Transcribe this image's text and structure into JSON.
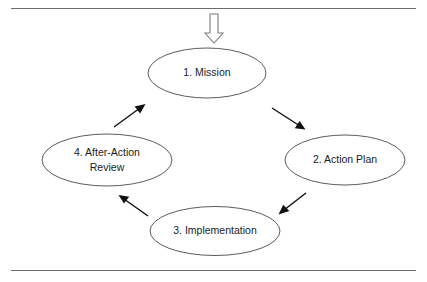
{
  "figure": {
    "background_color": "#ffffff",
    "node_outline_color": "#4a4a4a",
    "arrow_color": "#111111",
    "rule_color": "#6b6b6b",
    "text_color": "#1c1c1c"
  },
  "frame": {
    "top_rule_label": "top-horizontal-rule",
    "bottom_rule_label": "bottom-horizontal-rule"
  },
  "entry_arrow": {
    "icon": "block-arrow-down-icon",
    "description": "Hollow outlined block arrow pointing down into stage 1",
    "direction": "down",
    "filled": false
  },
  "nodes": [
    {
      "id": "mission",
      "label": "1. Mission",
      "number": "1",
      "name": "Mission",
      "lines": [
        "1. Mission"
      ],
      "position": "top"
    },
    {
      "id": "action-plan",
      "label": "2. Action Plan",
      "number": "2",
      "name": "Action Plan",
      "lines": [
        "2. Action Plan"
      ],
      "position": "right"
    },
    {
      "id": "implementation",
      "label": "3. Implementation",
      "number": "3",
      "name": "Implementation",
      "lines": [
        "3. Implementation"
      ],
      "position": "bottom"
    },
    {
      "id": "after-action-review",
      "label": "4. After-Action Review",
      "number": "4",
      "name": "After-Action Review",
      "lines": [
        "4. After-Action",
        "Review"
      ],
      "position": "left"
    }
  ],
  "connectors": [
    {
      "id": "mission-to-action-plan",
      "from": "1. Mission",
      "to": "2. Action Plan",
      "direction": "down-right"
    },
    {
      "id": "action-plan-to-implementation",
      "from": "2. Action Plan",
      "to": "3. Implementation",
      "direction": "down-left"
    },
    {
      "id": "implementation-to-after-action-review",
      "from": "3. Implementation",
      "to": "4. After-Action Review",
      "direction": "up-left"
    },
    {
      "id": "after-action-review-to-mission",
      "from": "4. After-Action Review",
      "to": "1. Mission",
      "direction": "up-right"
    }
  ],
  "cycle_order": [
    "1. Mission",
    "2. Action Plan",
    "3. Implementation",
    "4. After-Action Review"
  ]
}
